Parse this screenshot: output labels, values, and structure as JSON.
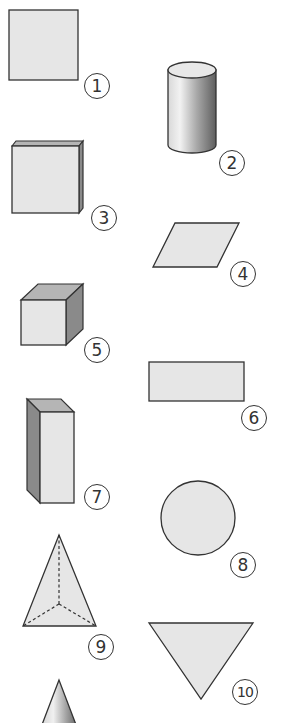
{
  "figure": {
    "type": "geometric-shapes-worksheet",
    "colors": {
      "fill": "#e6e6e6",
      "outline": "#333333",
      "side_shade": "#8a8a8a",
      "top_shade": "#b5b5b5",
      "background": "#ffffff"
    },
    "shapes": [
      {
        "number": "1",
        "name": "square"
      },
      {
        "number": "2",
        "name": "cylinder"
      },
      {
        "number": "3",
        "name": "cuboid-flat"
      },
      {
        "number": "4",
        "name": "parallelogram"
      },
      {
        "number": "5",
        "name": "cube"
      },
      {
        "number": "6",
        "name": "rectangle"
      },
      {
        "number": "7",
        "name": "cuboid-tall"
      },
      {
        "number": "8",
        "name": "circle"
      },
      {
        "number": "9",
        "name": "triangular-pyramid"
      },
      {
        "number": "10",
        "name": "triangle"
      },
      {
        "number": "11",
        "name": "cone"
      }
    ]
  }
}
